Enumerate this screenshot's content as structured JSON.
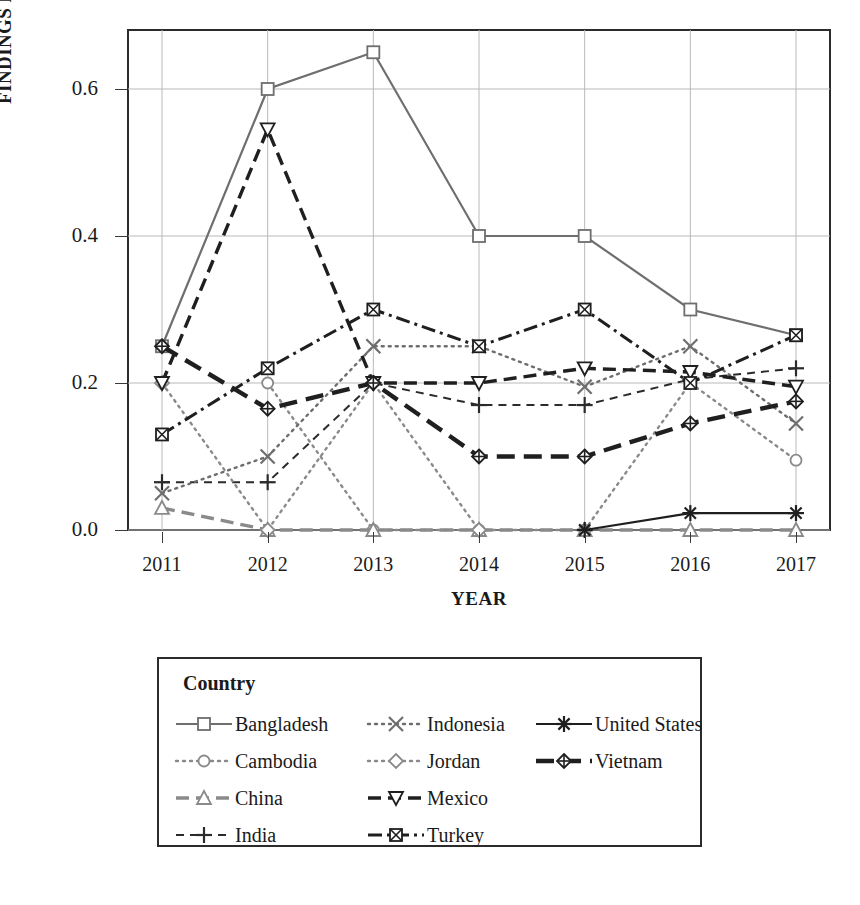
{
  "chart_data": {
    "type": "line",
    "title": "",
    "xlabel": "YEAR",
    "ylabel": "FINDINGS PER AUDIT",
    "categories": [
      "2011",
      "2012",
      "2013",
      "2014",
      "2015",
      "2016",
      "2017"
    ],
    "x_tick_labels": [
      "2011",
      "2012",
      "2013",
      "2014",
      "2015",
      "2016",
      "2017"
    ],
    "y_tick_labels": [
      "0.0",
      "0.2",
      "0.4",
      "0.6"
    ],
    "y_ticks": [
      0.0,
      0.2,
      0.4,
      0.6
    ],
    "ylim": [
      -0.035,
      0.7
    ],
    "grid": true,
    "legend_position": "below-plot",
    "legend_title": "Country",
    "series": [
      {
        "name": "Bangladesh",
        "marker": "open-square",
        "line_style": "solid",
        "color": "#6e6e6e",
        "values": [
          0.25,
          0.6,
          0.65,
          0.4,
          0.4,
          0.3,
          0.265
        ]
      },
      {
        "name": "Cambodia",
        "marker": "open-circle",
        "line_style": "dotted",
        "color": "#8a8a8a",
        "values": [
          null,
          0.2,
          0.0,
          0.0,
          0.0,
          0.2,
          0.095
        ]
      },
      {
        "name": "China",
        "marker": "open-triangle-up",
        "line_style": "dashed",
        "color": "#8a8a8a",
        "values": [
          0.03,
          0.0,
          0.0,
          0.0,
          0.0,
          0.0,
          0.0
        ]
      },
      {
        "name": "India",
        "marker": "plus",
        "line_style": "dashed-short",
        "color": "#2b2b2b",
        "values": [
          0.065,
          0.065,
          0.2,
          0.17,
          0.17,
          0.205,
          0.22
        ]
      },
      {
        "name": "Indonesia",
        "marker": "x-cross",
        "line_style": "dotted",
        "color": "#6e6e6e",
        "values": [
          0.05,
          0.1,
          0.25,
          0.25,
          0.195,
          0.25,
          0.145
        ]
      },
      {
        "name": "Jordan",
        "marker": "open-diamond",
        "line_style": "dotted",
        "color": "#8a8a8a",
        "values": [
          0.2,
          0.0,
          0.2,
          0.0,
          null,
          null,
          null
        ]
      },
      {
        "name": "Mexico",
        "marker": "open-triangle-down",
        "line_style": "dashed",
        "color": "#1f1f1f",
        "values": [
          0.2,
          0.545,
          0.2,
          0.2,
          0.22,
          0.215,
          0.195
        ]
      },
      {
        "name": "Turkey",
        "marker": "crossed-square",
        "line_style": "dash-dot",
        "color": "#1f1f1f",
        "values": [
          0.13,
          0.22,
          0.3,
          0.25,
          0.3,
          0.2,
          0.265
        ]
      },
      {
        "name": "United States",
        "marker": "asterisk",
        "line_style": "solid",
        "color": "#1f1f1f",
        "values": [
          null,
          null,
          null,
          null,
          0.0,
          0.023,
          0.023
        ]
      },
      {
        "name": "Vietnam",
        "marker": "diamond-plus",
        "line_style": "long-dash",
        "color": "#1f1f1f",
        "values": [
          0.25,
          0.165,
          0.2,
          0.1,
          0.1,
          0.145,
          0.175
        ]
      }
    ],
    "annotations": []
  },
  "legend": {
    "title": "Country",
    "columns": [
      [
        "Bangladesh",
        "Cambodia",
        "China",
        "India"
      ],
      [
        "Indonesia",
        "Jordan",
        "Mexico",
        "Turkey"
      ],
      [
        "United States",
        "Vietnam"
      ]
    ]
  }
}
